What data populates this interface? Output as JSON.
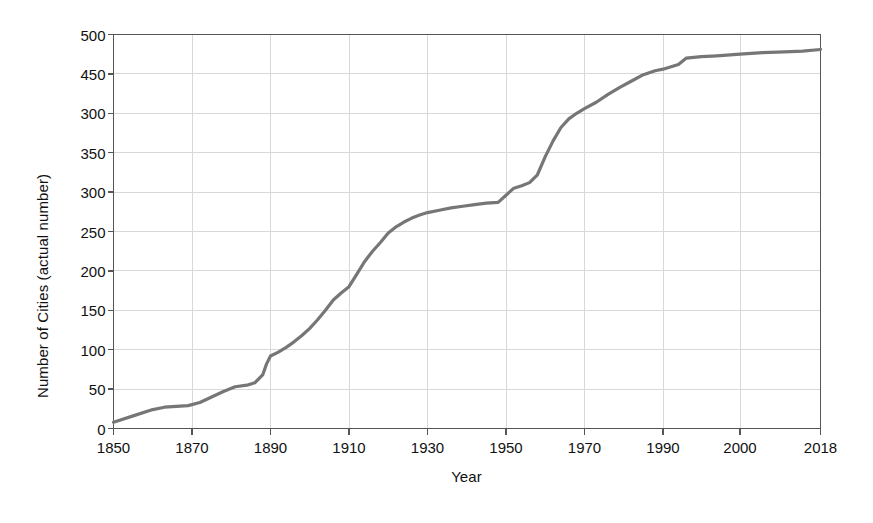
{
  "chart_data": {
    "type": "line",
    "title": "",
    "xlabel": "Year",
    "ylabel": "Number of Cities (actual number)",
    "xlim": [
      1850,
      2018
    ],
    "ylim": [
      0,
      500
    ],
    "grid": true,
    "legend": "none",
    "line_color": "#767676",
    "grid_color": "#d8d8d8",
    "axis_color": "#555555",
    "x_tick_labels": [
      "1850",
      "1870",
      "1890",
      "1910",
      "1930",
      "1950",
      "1970",
      "1990",
      "2000",
      "2018"
    ],
    "x_tick_values": [
      1850,
      1870,
      1890,
      1910,
      1930,
      1950,
      1970,
      1990,
      2000,
      2018
    ],
    "y_tick_labels": [
      "500",
      "450",
      "300",
      "350",
      "300",
      "250",
      "200",
      "150",
      "100",
      "50",
      "0"
    ],
    "y_tick_values": [
      500,
      450,
      400,
      350,
      300,
      250,
      200,
      150,
      100,
      50,
      0
    ],
    "series": [
      {
        "name": "Number of Cities",
        "x": [
          1850,
          1855,
          1860,
          1863,
          1866,
          1869,
          1872,
          1875,
          1878,
          1881,
          1884,
          1886,
          1888,
          1889,
          1890,
          1892,
          1894,
          1896,
          1898,
          1900,
          1902,
          1904,
          1906,
          1908,
          1910,
          1912,
          1914,
          1916,
          1918,
          1920,
          1922,
          1924,
          1926,
          1928,
          1930,
          1933,
          1936,
          1939,
          1942,
          1945,
          1948,
          1950,
          1952,
          1954,
          1956,
          1958,
          1960,
          1962,
          1964,
          1966,
          1968,
          1970,
          1973,
          1976,
          1979,
          1982,
          1985,
          1988,
          1990,
          1992,
          1993,
          1995,
          1997,
          2000,
          2005,
          2010,
          2014,
          2018
        ],
        "y": [
          8,
          16,
          24,
          27,
          28,
          29,
          33,
          40,
          47,
          53,
          55,
          58,
          68,
          82,
          92,
          97,
          103,
          110,
          118,
          127,
          138,
          150,
          163,
          172,
          180,
          196,
          212,
          225,
          236,
          248,
          256,
          262,
          267,
          271,
          274,
          277,
          280,
          282,
          284,
          286,
          287,
          296,
          305,
          308,
          312,
          322,
          345,
          365,
          382,
          393,
          400,
          406,
          414,
          424,
          433,
          441,
          449,
          454,
          456,
          462,
          470,
          472,
          473,
          475,
          477,
          478,
          479,
          481
        ]
      }
    ]
  },
  "axes": {
    "x_title": "Year",
    "y_title": "Number of Cities (actual number)"
  }
}
